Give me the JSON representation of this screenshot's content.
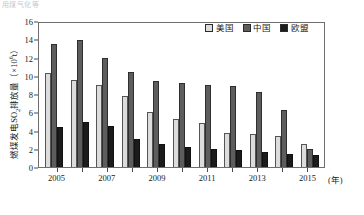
{
  "top_fragment": "用煤气化等",
  "axes": {
    "y_label_prefix": "燃煤发电SO",
    "y_label_sub": "2",
    "y_label_mid": "排放量（×10",
    "y_label_sup": "6",
    "y_label_suffix": "t）",
    "y_ticks": [
      0,
      2,
      4,
      6,
      8,
      10,
      12,
      14,
      16
    ],
    "x_unit": "(年)",
    "x_tick_labels": [
      "2005",
      "2007",
      "2009",
      "2011",
      "2013",
      "2015"
    ]
  },
  "legend": {
    "items": [
      {
        "label": "美国",
        "color": "#dcdcdc"
      },
      {
        "label": "中国",
        "color": "#5d5d5d"
      },
      {
        "label": "欧盟",
        "color": "#1b1b1b"
      }
    ]
  },
  "chart_data": {
    "type": "bar",
    "title": "",
    "xlabel": "(年)",
    "ylabel": "燃煤发电SO2排放量（×10^6 t）",
    "ylim": [
      0,
      16
    ],
    "grid": false,
    "legend_position": "top-right",
    "categories": [
      "2005",
      "2006",
      "2007",
      "2008",
      "2009",
      "2010",
      "2011",
      "2012",
      "2013",
      "2014",
      "2015"
    ],
    "series": [
      {
        "name": "美国",
        "color": "#dcdcdc",
        "values": [
          10.3,
          9.5,
          9.0,
          7.8,
          6.0,
          5.3,
          4.8,
          3.7,
          3.6,
          3.4,
          2.5
        ]
      },
      {
        "name": "中国",
        "color": "#5d5d5d",
        "values": [
          13.5,
          13.9,
          12.0,
          10.4,
          9.4,
          9.2,
          9.0,
          8.9,
          8.2,
          6.2,
          2.0
        ]
      },
      {
        "name": "欧盟",
        "color": "#1b1b1b",
        "values": [
          4.4,
          4.9,
          4.5,
          3.1,
          2.5,
          2.2,
          2.0,
          1.9,
          1.6,
          1.4,
          1.3
        ]
      }
    ]
  }
}
